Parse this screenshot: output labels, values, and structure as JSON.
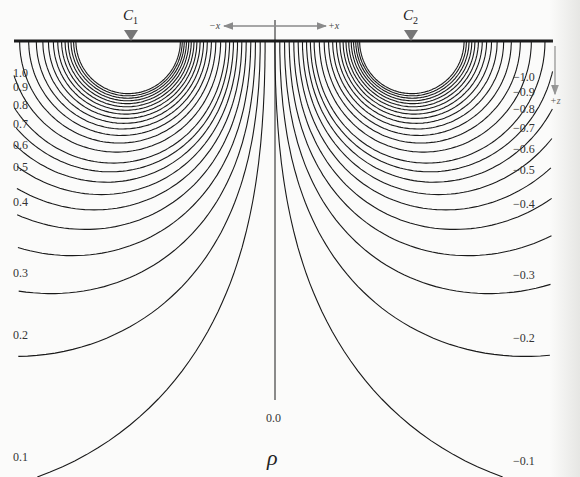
{
  "figure": {
    "electrodes": [
      {
        "id": "C1",
        "letter": "C",
        "subscript": "1",
        "x": 130
      },
      {
        "id": "C2",
        "letter": "C",
        "subscript": "2",
        "x": 410
      }
    ],
    "axes": {
      "neg_x_label": "−x",
      "pos_x_label": "+x",
      "z_label": "+z"
    },
    "center_label": "0.0",
    "quantity_symbol": "ρ",
    "colors": {
      "lines": "#1a1a1a",
      "arrows": "#8a8a8a",
      "electrode_marker": "#777777",
      "background": "#fbfbfa"
    }
  },
  "chart_data": {
    "type": "contour",
    "xlabel": "x",
    "ylabel": "z (depth)",
    "positive_labels": [
      {
        "value": "1.0",
        "y": 73
      },
      {
        "value": "0.9",
        "y": 87
      },
      {
        "value": "0.8",
        "y": 105
      },
      {
        "value": "0.7",
        "y": 124
      },
      {
        "value": "0.6",
        "y": 145
      },
      {
        "value": "0.5",
        "y": 167
      },
      {
        "value": "0.4",
        "y": 202
      },
      {
        "value": "0.3",
        "y": 273
      },
      {
        "value": "0.2",
        "y": 335
      },
      {
        "value": "0.1",
        "y": 457
      }
    ],
    "negative_labels": [
      {
        "value": "−1.0",
        "y": 77
      },
      {
        "value": "−0.9",
        "y": 92
      },
      {
        "value": "−0.8",
        "y": 109
      },
      {
        "value": "−0.7",
        "y": 128
      },
      {
        "value": "−0.6",
        "y": 149
      },
      {
        "value": "−0.5",
        "y": 170
      },
      {
        "value": "−0.4",
        "y": 204
      },
      {
        "value": "−0.3",
        "y": 275
      },
      {
        "value": "−0.2",
        "y": 338
      },
      {
        "value": "−0.1",
        "y": 461
      }
    ],
    "zero_line": {
      "value": "0.0",
      "x": 275
    }
  }
}
